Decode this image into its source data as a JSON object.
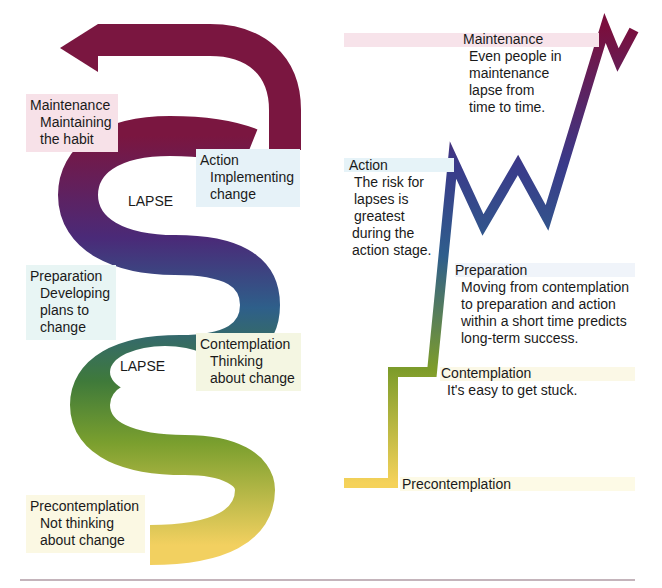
{
  "spiral": {
    "stages": [
      {
        "title": "Maintenance",
        "desc": [
          "Maintaining",
          "the habit"
        ],
        "bg": "#f7e1e8"
      },
      {
        "title": "Action",
        "desc": [
          "Implementing",
          "change"
        ],
        "bg": "#e6f2f8"
      },
      {
        "title": "Preparation",
        "desc": [
          "Developing",
          "plans to",
          "change"
        ],
        "bg": "#e8f5f4"
      },
      {
        "title": "Contemplation",
        "desc": [
          "Thinking",
          "about change"
        ],
        "bg": "#f4f6e2"
      },
      {
        "title": "Precontemplation",
        "desc": [
          "Not thinking",
          "about change"
        ],
        "bg": "#fbf8e3"
      }
    ],
    "lapse_labels": [
      "LAPSE",
      "LAPSE"
    ],
    "colors": {
      "maintenance": "#7a1640",
      "action": "#4a2a78",
      "preparation": "#2e5f8a",
      "contemplation": "#6f9a2c",
      "precontemplation": "#f0cc50"
    }
  },
  "path_chart": {
    "stages": [
      {
        "title": "Maintenance",
        "desc": [
          "Even people in",
          "maintenance",
          "lapse from",
          "time to time."
        ]
      },
      {
        "title": "Action",
        "desc": [
          "The risk for",
          "lapses is",
          "greatest",
          "during the",
          "action stage."
        ]
      },
      {
        "title": "Preparation",
        "desc": [
          "Moving from contemplation",
          "to preparation and action",
          "within a short time predicts",
          "long-term success."
        ]
      },
      {
        "title": "Contemplation",
        "desc": [
          "It's easy to get stuck."
        ]
      },
      {
        "title": "Precontemplation",
        "desc": []
      }
    ]
  }
}
